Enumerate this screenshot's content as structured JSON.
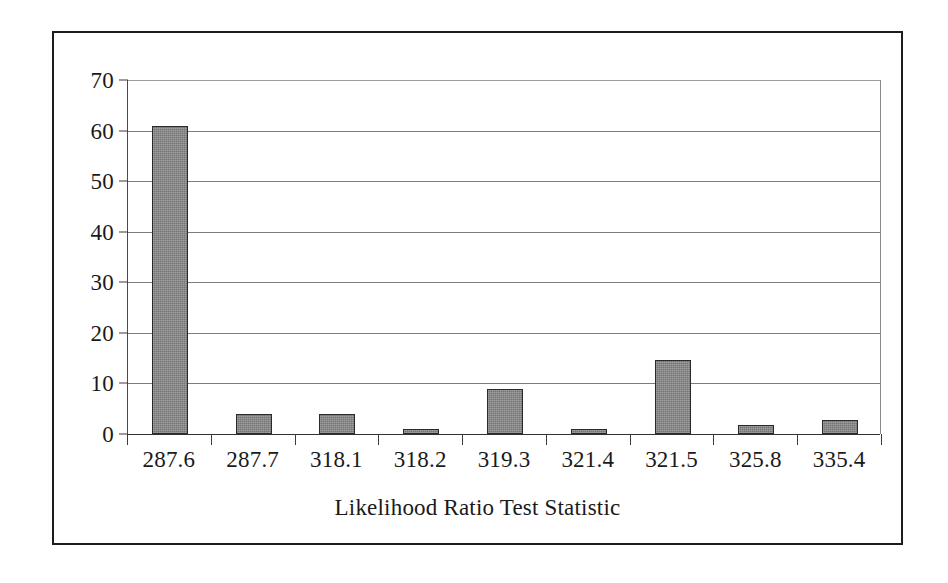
{
  "figure": {
    "x_axis_title": "Likelihood Ratio Test Statistic",
    "frame_color": "#1c1c1c",
    "bar_fill_color": "#858585",
    "bar_border_color": "#2a2a2a",
    "gridline_color": "#7c7c7c"
  },
  "chart_data": {
    "type": "bar",
    "title": "",
    "subtitle": "",
    "xlabel": "Likelihood Ratio Test Statistic",
    "ylabel": "",
    "categories": [
      "287.6",
      "287.7",
      "318.1",
      "318.2",
      "319.3",
      "321.4",
      "321.5",
      "325.8",
      "335.4"
    ],
    "values": [
      61,
      4,
      4,
      1,
      9,
      1,
      14.6,
      1.8,
      2.7
    ],
    "ylim": [
      0,
      70
    ],
    "ytick_labels": [
      "0",
      "10",
      "20",
      "30",
      "40",
      "50",
      "60",
      "70"
    ],
    "ytick_values": [
      0,
      10,
      20,
      30,
      40,
      50,
      60,
      70
    ],
    "grid": true,
    "grid_axis": "y",
    "legend": false,
    "legend_position": "none",
    "series": [
      {
        "name": "frequency",
        "values": [
          61,
          4,
          4,
          1,
          9,
          1,
          14.6,
          1.8,
          2.7
        ]
      }
    ]
  }
}
